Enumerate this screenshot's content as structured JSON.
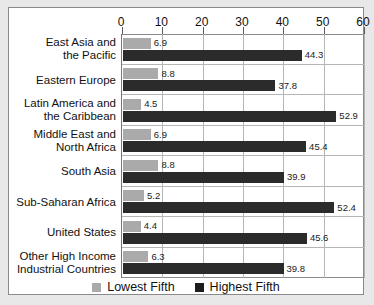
{
  "chart_data": {
    "type": "bar",
    "orientation": "horizontal",
    "title": "",
    "xlabel": "",
    "ylabel": "",
    "xlim": [
      0,
      60
    ],
    "xticks": [
      0,
      10,
      20,
      30,
      40,
      50,
      60
    ],
    "grid": true,
    "legend_position": "bottom-center",
    "categories": [
      "East Asia and\nthe Pacific",
      "Eastern Europe",
      "Latin America and\nthe Caribbean",
      "Middle East and\nNorth Africa",
      "South Asia",
      "Sub-Saharan Africa",
      "United States",
      "Other High Income\nIndustrial Countries"
    ],
    "series": [
      {
        "name": "Lowest Fifth",
        "color": "#aaaaaa",
        "values": [
          6.9,
          8.8,
          4.5,
          6.9,
          8.8,
          5.2,
          4.4,
          6.3
        ]
      },
      {
        "name": "Highest Fifth",
        "color": "#2b2b2b",
        "values": [
          44.3,
          37.8,
          52.9,
          45.4,
          39.9,
          52.4,
          45.6,
          39.8
        ]
      }
    ]
  },
  "categories": [
    {
      "line1": "East Asia and",
      "line2": "the Pacific"
    },
    {
      "line1": "Eastern Europe",
      "line2": ""
    },
    {
      "line1": "Latin America and",
      "line2": "the Caribbean"
    },
    {
      "line1": "Middle East and",
      "line2": "North Africa"
    },
    {
      "line1": "South Asia",
      "line2": ""
    },
    {
      "line1": "Sub-Saharan Africa",
      "line2": ""
    },
    {
      "line1": "United States",
      "line2": ""
    },
    {
      "line1": "Other High Income",
      "line2": "Industrial Countries"
    }
  ],
  "axis": {
    "ticks": [
      "0",
      "10",
      "20",
      "30",
      "40",
      "50",
      "60"
    ]
  },
  "legend": {
    "items": [
      {
        "label": "Lowest Fifth",
        "color": "#aaaaaa",
        "swatch": "lowest"
      },
      {
        "label": "Highest Fifth",
        "color": "#1c1c1c",
        "swatch": "highest"
      }
    ]
  },
  "bar_labels": {
    "lowest": [
      "6.9",
      "8.8",
      "4.5",
      "6.9",
      "8.8",
      "5.2",
      "4.4",
      "6.3"
    ],
    "highest": [
      "44.3",
      "37.8",
      "52.9",
      "45.4",
      "39.9",
      "52.4",
      "45.6",
      "39.8"
    ]
  },
  "colors": {
    "lowest_fifth": "#aaaaaa",
    "highest_fifth": "#2b2b2b",
    "grid": "#b5b5b5",
    "frame": "#8a8a8a",
    "page_background": "#e8e8e8",
    "plot_background": "#ffffff"
  }
}
